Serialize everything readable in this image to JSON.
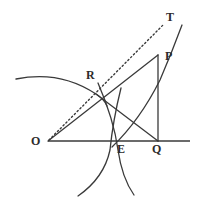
{
  "figure": {
    "kind": "geometry-diagram",
    "width": 202,
    "height": 211,
    "background_color": "#ffffff",
    "stroke_color": "#3a3a3a",
    "baseline_color": "#6b6b6b",
    "label_color": "#2b2b2b"
  },
  "labels": [
    {
      "id": "O",
      "text": "O",
      "x": 31,
      "y": 135
    },
    {
      "id": "R",
      "text": "R",
      "x": 86,
      "y": 69
    },
    {
      "id": "T",
      "text": "T",
      "x": 166,
      "y": 11
    },
    {
      "id": "P",
      "text": "P",
      "x": 165,
      "y": 50
    },
    {
      "id": "E",
      "text": "E",
      "x": 117,
      "y": 143
    },
    {
      "id": "Q",
      "text": "Q",
      "x": 152,
      "y": 143
    }
  ],
  "points": {
    "O": {
      "x": 48,
      "y": 141
    },
    "R": {
      "x": 96,
      "y": 94
    },
    "E": {
      "x": 114,
      "y": 141
    },
    "Q": {
      "x": 158,
      "y": 141
    },
    "P": {
      "x": 158,
      "y": 55
    },
    "T": {
      "x": 163,
      "y": 22
    }
  },
  "segments": {
    "baseline": {
      "name": "horizontal-axis",
      "x1": 48,
      "y1": 141,
      "x2": 190,
      "y2": 141,
      "style": "solid"
    },
    "ray_o_to_p": {
      "name": "ray-O-through-R-to-P",
      "x1": 48,
      "y1": 141,
      "x2": 158,
      "y2": 55,
      "style": "solid"
    },
    "dotted_o_to_t": {
      "name": "dotted-ray-O-to-T",
      "x1": 49,
      "y1": 140,
      "x2": 164,
      "y2": 24,
      "style": "dotted"
    },
    "chord_r_to_q": {
      "name": "segment-R-to-Q",
      "x1": 96,
      "y1": 94,
      "x2": 158,
      "y2": 141,
      "style": "solid"
    },
    "vertical_p_to_q": {
      "name": "segment-P-to-Q",
      "x1": 158,
      "y1": 55,
      "x2": 158,
      "y2": 141,
      "style": "solid"
    }
  },
  "curves": {
    "upper_left_arc": {
      "name": "arc-through-R",
      "path": "M 16 79 Q 60 70 96 94 Q 104 99 107 106",
      "style": "solid"
    },
    "arc_left_through_e": {
      "name": "arc-left-crossing-at-E",
      "path": "M 98 83 Q 114 120 118 150 Q 122 178 134 195",
      "style": "solid"
    },
    "arc_right_through_e": {
      "name": "arc-right-crossing-at-E",
      "path": "M 121 88 Q 113 120 110 150 Q 104 178 78 196",
      "style": "solid"
    },
    "rising_curve_e_to_t": {
      "name": "curve-from-E-to-T",
      "path": "M 112 147 Q 140 120 160 80 Q 172 52 182 25",
      "style": "solid"
    }
  },
  "styling": {
    "stroke_width_curve": 1.3,
    "stroke_width_line": 1.3,
    "stroke_width_baseline": 2,
    "dot_dash_pattern": "1.4 2.6"
  }
}
